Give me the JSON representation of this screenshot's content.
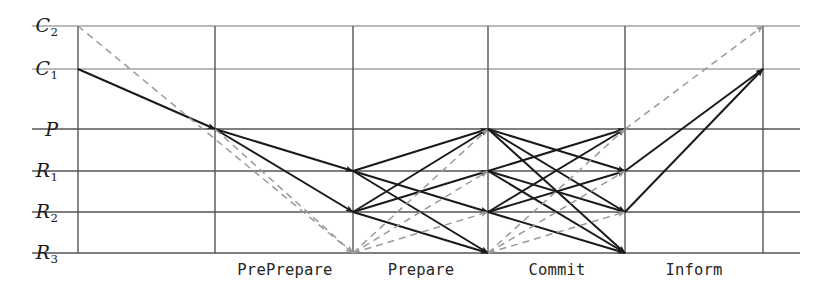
{
  "diagram": {
    "type": "message-sequence-lattice",
    "colors": {
      "solid_line": "#1a1a1a",
      "dashed_line": "#9a9a9a",
      "grid_line": "#555555",
      "text": "#262626",
      "background": "#ffffff"
    },
    "rows": [
      {
        "id": "C2",
        "label_base": "C",
        "label_sub": "2",
        "style": "script",
        "y": 26
      },
      {
        "id": "C1",
        "label_base": "C",
        "label_sub": "1",
        "style": "script",
        "y": 69
      },
      {
        "id": "P",
        "label_base": "P",
        "label_sub": "",
        "style": "roman",
        "y": 129
      },
      {
        "id": "R1",
        "label_base": "R",
        "label_sub": "1",
        "style": "roman",
        "y": 171
      },
      {
        "id": "R2",
        "label_base": "R",
        "label_sub": "2",
        "style": "roman",
        "y": 212
      },
      {
        "id": "R3",
        "label_base": "R",
        "label_sub": "3",
        "style": "roman",
        "y": 253
      }
    ],
    "columns_x": [
      78,
      215,
      353,
      488,
      625,
      763
    ],
    "phases": [
      {
        "label": "PrePrepare",
        "x": 285
      },
      {
        "label": "Prepare",
        "x": 421
      },
      {
        "label": "Commit",
        "x": 557
      },
      {
        "label": "Inform",
        "x": 694
      }
    ],
    "baseline_y": 253,
    "grid_left_x": 32,
    "grid_right_x": 800,
    "messages": [
      {
        "phase": "Request",
        "from": "C1",
        "to": "P",
        "x1": 78,
        "y1": 69,
        "x2": 215,
        "y2": 129,
        "style": "solid"
      },
      {
        "phase": "Request",
        "from": "C2",
        "to": "R3",
        "x1": 78,
        "y1": 26,
        "x2": 353,
        "y2": 253,
        "style": "dashed"
      },
      {
        "phase": "PrePrepare",
        "from": "P",
        "to": "R1",
        "x1": 215,
        "y1": 129,
        "x2": 353,
        "y2": 171,
        "style": "solid"
      },
      {
        "phase": "PrePrepare",
        "from": "P",
        "to": "R2",
        "x1": 215,
        "y1": 129,
        "x2": 353,
        "y2": 212,
        "style": "solid"
      },
      {
        "phase": "PrePrepare",
        "from": "P",
        "to": "R3",
        "x1": 215,
        "y1": 129,
        "x2": 353,
        "y2": 253,
        "style": "dashed"
      },
      {
        "phase": "Prepare",
        "from": "R1",
        "to": "P",
        "x1": 353,
        "y1": 171,
        "x2": 488,
        "y2": 129,
        "style": "solid"
      },
      {
        "phase": "Prepare",
        "from": "R1",
        "to": "R2",
        "x1": 353,
        "y1": 171,
        "x2": 488,
        "y2": 212,
        "style": "solid"
      },
      {
        "phase": "Prepare",
        "from": "R1",
        "to": "R3",
        "x1": 353,
        "y1": 171,
        "x2": 488,
        "y2": 253,
        "style": "solid"
      },
      {
        "phase": "Prepare",
        "from": "R2",
        "to": "P",
        "x1": 353,
        "y1": 212,
        "x2": 488,
        "y2": 129,
        "style": "solid"
      },
      {
        "phase": "Prepare",
        "from": "R2",
        "to": "R1",
        "x1": 353,
        "y1": 212,
        "x2": 488,
        "y2": 171,
        "style": "solid"
      },
      {
        "phase": "Prepare",
        "from": "R2",
        "to": "R3",
        "x1": 353,
        "y1": 212,
        "x2": 488,
        "y2": 253,
        "style": "solid"
      },
      {
        "phase": "Prepare",
        "from": "R3",
        "to": "P",
        "x1": 353,
        "y1": 253,
        "x2": 488,
        "y2": 129,
        "style": "dashed"
      },
      {
        "phase": "Prepare",
        "from": "R3",
        "to": "R1",
        "x1": 353,
        "y1": 253,
        "x2": 488,
        "y2": 171,
        "style": "dashed"
      },
      {
        "phase": "Prepare",
        "from": "R3",
        "to": "R2",
        "x1": 353,
        "y1": 253,
        "x2": 488,
        "y2": 212,
        "style": "dashed"
      },
      {
        "phase": "Commit",
        "from": "P",
        "to": "R1",
        "x1": 488,
        "y1": 129,
        "x2": 625,
        "y2": 171,
        "style": "solid"
      },
      {
        "phase": "Commit",
        "from": "P",
        "to": "R2",
        "x1": 488,
        "y1": 129,
        "x2": 625,
        "y2": 212,
        "style": "solid"
      },
      {
        "phase": "Commit",
        "from": "P",
        "to": "R3",
        "x1": 488,
        "y1": 129,
        "x2": 625,
        "y2": 253,
        "style": "solid"
      },
      {
        "phase": "Commit",
        "from": "R1",
        "to": "P",
        "x1": 488,
        "y1": 171,
        "x2": 625,
        "y2": 129,
        "style": "solid"
      },
      {
        "phase": "Commit",
        "from": "R1",
        "to": "R2",
        "x1": 488,
        "y1": 171,
        "x2": 625,
        "y2": 212,
        "style": "solid"
      },
      {
        "phase": "Commit",
        "from": "R1",
        "to": "R3",
        "x1": 488,
        "y1": 171,
        "x2": 625,
        "y2": 253,
        "style": "solid"
      },
      {
        "phase": "Commit",
        "from": "R2",
        "to": "P",
        "x1": 488,
        "y1": 212,
        "x2": 625,
        "y2": 129,
        "style": "solid"
      },
      {
        "phase": "Commit",
        "from": "R2",
        "to": "R1",
        "x1": 488,
        "y1": 212,
        "x2": 625,
        "y2": 171,
        "style": "solid"
      },
      {
        "phase": "Commit",
        "from": "R2",
        "to": "R3",
        "x1": 488,
        "y1": 212,
        "x2": 625,
        "y2": 253,
        "style": "solid"
      },
      {
        "phase": "Commit",
        "from": "R3",
        "to": "P",
        "x1": 488,
        "y1": 253,
        "x2": 625,
        "y2": 129,
        "style": "dashed"
      },
      {
        "phase": "Commit",
        "from": "R3",
        "to": "R1",
        "x1": 488,
        "y1": 253,
        "x2": 625,
        "y2": 171,
        "style": "dashed"
      },
      {
        "phase": "Commit",
        "from": "R3",
        "to": "R2",
        "x1": 488,
        "y1": 253,
        "x2": 625,
        "y2": 212,
        "style": "dashed"
      },
      {
        "phase": "Inform",
        "from": "P",
        "to": "C2",
        "x1": 625,
        "y1": 129,
        "x2": 763,
        "y2": 26,
        "style": "dashed"
      },
      {
        "phase": "Inform",
        "from": "R1",
        "to": "C1",
        "x1": 625,
        "y1": 171,
        "x2": 763,
        "y2": 69,
        "style": "solid"
      },
      {
        "phase": "Inform",
        "from": "R2",
        "to": "C1",
        "x1": 625,
        "y1": 212,
        "x2": 763,
        "y2": 69,
        "style": "solid"
      }
    ]
  }
}
